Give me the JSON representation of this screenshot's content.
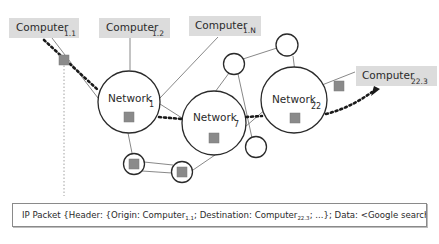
{
  "diagram": {
    "computers": [
      {
        "id": "c11",
        "label": "Computer",
        "sub": "1.1"
      },
      {
        "id": "c12",
        "label": "Computer",
        "sub": "1.2"
      },
      {
        "id": "c1n",
        "label": "Computer",
        "sub": "1.N"
      },
      {
        "id": "c223",
        "label": "Computer",
        "sub": "22.3"
      }
    ],
    "networks": [
      {
        "id": "n1",
        "label": "Network",
        "sub": "1"
      },
      {
        "id": "n7",
        "label": "Network",
        "sub": "7"
      },
      {
        "id": "n22",
        "label": "Network",
        "sub": "22"
      }
    ],
    "small_nodes_count": 5,
    "packet_markers_count": 7,
    "route": "Computer 1.1 -> Network 1 -> Network 7 -> Network 22 -> Computer 22.3"
  },
  "packet": {
    "prefix": "IP Packet {Header: {Origin: Computer",
    "origin_sub": "1.1",
    "middle": "; Destination: Computer",
    "dest_sub": "22.3",
    "suffix": "; ...}; Data: <Google search results>}"
  },
  "colors": {
    "computer_box": "#dcdcdc",
    "packet_marker": "#8a8a8a",
    "route_line": "#1a1a1a",
    "node_stroke": "#2a2a2a"
  }
}
